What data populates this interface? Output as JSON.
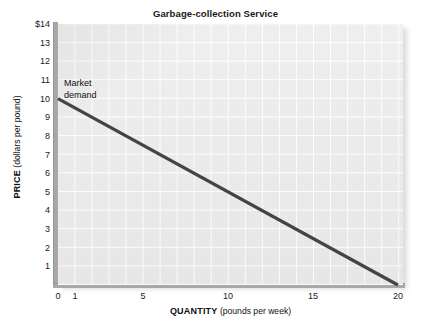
{
  "chart_data": {
    "type": "line",
    "title": "Garbage-collection Service",
    "xlabel_bold": "QUANTITY",
    "xlabel_rest": " (pounds per week)",
    "ylabel_bold": "PRICE",
    "ylabel_rest": " (dollars per pound)",
    "xlim": [
      0,
      20.3
    ],
    "ylim": [
      0,
      14
    ],
    "grid": true,
    "legend": "none",
    "x_ticks": [
      {
        "value": 0,
        "label": "0"
      },
      {
        "value": 1,
        "label": "1"
      },
      {
        "value": 5,
        "label": "5"
      },
      {
        "value": 10,
        "label": "10"
      },
      {
        "value": 15,
        "label": "15"
      },
      {
        "value": 20,
        "label": "20"
      }
    ],
    "y_ticks": [
      {
        "value": 14,
        "label": "$14"
      },
      {
        "value": 13,
        "label": "13"
      },
      {
        "value": 12,
        "label": "12"
      },
      {
        "value": 11,
        "label": "11"
      },
      {
        "value": 10,
        "label": "10"
      },
      {
        "value": 9,
        "label": "9"
      },
      {
        "value": 8,
        "label": "8"
      },
      {
        "value": 7,
        "label": "7"
      },
      {
        "value": 6,
        "label": "6"
      },
      {
        "value": 5,
        "label": "5"
      },
      {
        "value": 4,
        "label": "4"
      },
      {
        "value": 3,
        "label": "3"
      },
      {
        "value": 2,
        "label": "2"
      },
      {
        "value": 1,
        "label": "1"
      }
    ],
    "series": [
      {
        "name": "Market demand",
        "color": "#444444",
        "width": 3.2,
        "points": [
          {
            "x": 0,
            "y": 10
          },
          {
            "x": 20,
            "y": 0
          }
        ]
      }
    ],
    "annotations": [
      {
        "name": "market-demand-label",
        "line1": "Market",
        "line2": "demand",
        "x": 0.35,
        "y": 11.1
      }
    ],
    "colors": {
      "plot_background": "#ebebeb",
      "grid_line": "#ffffff",
      "axis": "#a8a8a8",
      "line": "#444444",
      "text": "#1a1a1a",
      "page_background": "#ffffff"
    }
  }
}
